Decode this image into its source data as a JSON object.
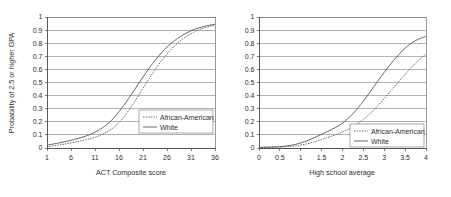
{
  "figure": {
    "background": "#ffffff",
    "line_color": "#4d4d4d",
    "grid_color": "#7d7d7d"
  },
  "chart_data": [
    {
      "type": "line",
      "panel": "left",
      "title": "",
      "xlabel": "ACT Composite score",
      "ylabel": "Probability of 2.5 or higher GPA",
      "xlim": [
        1,
        36
      ],
      "ylim": [
        0,
        1
      ],
      "grid": true,
      "legend_position": "inside-lower-right",
      "xticks": [
        1,
        6,
        11,
        16,
        21,
        26,
        31,
        36
      ],
      "xticklabels": [
        "1",
        "6",
        "11",
        "16",
        "21",
        "26",
        "31",
        "36"
      ],
      "yticks": [
        0,
        0.1,
        0.2,
        0.3,
        0.4,
        0.5,
        0.6,
        0.7,
        0.8,
        0.9,
        1
      ],
      "yticklabels": [
        "0",
        "0.1",
        "0.2",
        "0.3",
        "0.4",
        "0.5",
        "0.6",
        "0.7",
        "0.8",
        "0.9",
        "1"
      ],
      "x": [
        1,
        3,
        5,
        7,
        9,
        11,
        13,
        15,
        17,
        19,
        21,
        23,
        25,
        27,
        29,
        31,
        33,
        35,
        36
      ],
      "series": [
        {
          "name": "African-American",
          "style": "dotted",
          "values": [
            0.01,
            0.02,
            0.032,
            0.046,
            0.062,
            0.082,
            0.112,
            0.16,
            0.235,
            0.34,
            0.455,
            0.57,
            0.672,
            0.758,
            0.825,
            0.873,
            0.908,
            0.93,
            0.938
          ]
        },
        {
          "name": "White",
          "style": "solid",
          "values": [
            0.022,
            0.035,
            0.05,
            0.068,
            0.09,
            0.12,
            0.165,
            0.232,
            0.325,
            0.432,
            0.542,
            0.645,
            0.733,
            0.803,
            0.856,
            0.895,
            0.921,
            0.938,
            0.944
          ]
        }
      ]
    },
    {
      "type": "line",
      "panel": "right",
      "title": "",
      "xlabel": "High school average",
      "ylabel": "",
      "xlim": [
        0,
        4
      ],
      "ylim": [
        0,
        1
      ],
      "grid": true,
      "legend_position": "inside-lower-right",
      "xticks": [
        0,
        0.5,
        1,
        1.5,
        2,
        2.5,
        3,
        3.5,
        4
      ],
      "xticklabels": [
        "0",
        "0.5",
        "1",
        "1.5",
        "2",
        "2.5",
        "3",
        "3.5",
        "4"
      ],
      "yticks": [
        0,
        0.1,
        0.2,
        0.3,
        0.4,
        0.5,
        0.6,
        0.7,
        0.8,
        0.9,
        1
      ],
      "yticklabels": [
        "0",
        "0.1",
        "0.2",
        "0.3",
        "0.4",
        "0.5",
        "0.6",
        "0.7",
        "0.8",
        "0.9",
        "1"
      ],
      "x": [
        0,
        0.25,
        0.5,
        0.75,
        1,
        1.25,
        1.5,
        1.75,
        2,
        2.25,
        2.5,
        2.75,
        3,
        3.25,
        3.5,
        3.75,
        4
      ],
      "series": [
        {
          "name": "African-American",
          "style": "dotted",
          "values": [
            0.004,
            0.005,
            0.007,
            0.012,
            0.022,
            0.04,
            0.065,
            0.092,
            0.122,
            0.163,
            0.218,
            0.29,
            0.378,
            0.47,
            0.562,
            0.648,
            0.718
          ]
        },
        {
          "name": "White",
          "style": "solid",
          "values": [
            0.005,
            0.007,
            0.01,
            0.02,
            0.038,
            0.068,
            0.105,
            0.143,
            0.19,
            0.262,
            0.358,
            0.468,
            0.578,
            0.678,
            0.762,
            0.82,
            0.852
          ]
        }
      ]
    }
  ],
  "legend": {
    "entries": [
      {
        "label": "African-American",
        "style": "dotted"
      },
      {
        "label": "White",
        "style": "solid"
      }
    ]
  }
}
